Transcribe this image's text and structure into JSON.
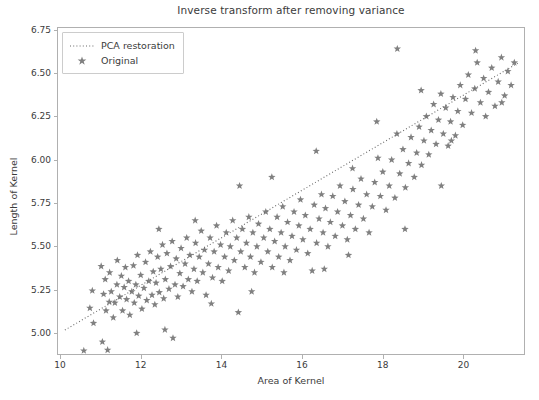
{
  "chart_data": {
    "type": "scatter",
    "title": "Inverse transform after removing variance",
    "xlabel": "Area of Kernel",
    "ylabel": "Length of Kernel",
    "xlim": [
      9.95,
      21.5
    ],
    "ylim": [
      4.88,
      6.76
    ],
    "grid": false,
    "legend_position": "upper left",
    "marker": "star",
    "marker_color": "#808080",
    "line_color": "#696969",
    "line_style": "dotted",
    "xticks": [
      10,
      12,
      14,
      16,
      18,
      20
    ],
    "xtick_labels": [
      "10",
      "12",
      "14",
      "16",
      "18",
      "20"
    ],
    "yticks": [
      5.0,
      5.25,
      5.5,
      5.75,
      6.0,
      6.25,
      6.5,
      6.75
    ],
    "ytick_labels": [
      "5.00",
      "5.25",
      "5.50",
      "5.75",
      "6.00",
      "6.25",
      "6.50",
      "6.75"
    ],
    "series": [
      {
        "name": "PCA restoration",
        "type": "line",
        "style": "dotted",
        "x": [
          10.12,
          21.35
        ],
        "y": [
          5.018,
          6.558
        ]
      },
      {
        "name": "Original",
        "type": "scatter",
        "marker": "star",
        "points": [
          [
            10.59,
            4.899
          ],
          [
            10.74,
            5.145
          ],
          [
            10.8,
            5.245
          ],
          [
            10.83,
            5.058
          ],
          [
            11.02,
            5.386
          ],
          [
            11.08,
            5.225
          ],
          [
            11.12,
            5.31
          ],
          [
            11.14,
            5.13
          ],
          [
            11.18,
            4.903
          ],
          [
            11.22,
            5.18
          ],
          [
            11.23,
            5.35
          ],
          [
            11.27,
            5.24
          ],
          [
            11.32,
            5.09
          ],
          [
            11.36,
            5.175
          ],
          [
            11.41,
            5.28
          ],
          [
            11.42,
            5.42
          ],
          [
            11.48,
            5.21
          ],
          [
            11.52,
            5.33
          ],
          [
            11.55,
            5.13
          ],
          [
            11.59,
            5.265
          ],
          [
            11.62,
            5.38
          ],
          [
            11.65,
            5.195
          ],
          [
            11.7,
            5.3
          ],
          [
            11.73,
            5.105
          ],
          [
            11.78,
            5.24
          ],
          [
            11.82,
            5.39
          ],
          [
            11.84,
            5.175
          ],
          [
            11.88,
            5.28
          ],
          [
            11.92,
            5.45
          ],
          [
            11.95,
            5.215
          ],
          [
            12.0,
            5.335
          ],
          [
            12.03,
            5.14
          ],
          [
            12.08,
            5.26
          ],
          [
            12.12,
            5.41
          ],
          [
            12.15,
            5.19
          ],
          [
            12.2,
            5.3
          ],
          [
            12.24,
            5.47
          ],
          [
            12.28,
            5.22
          ],
          [
            12.31,
            5.355
          ],
          [
            12.35,
            5.165
          ],
          [
            12.38,
            5.29
          ],
          [
            12.42,
            5.44
          ],
          [
            12.46,
            5.235
          ],
          [
            12.5,
            5.37
          ],
          [
            12.54,
            5.51
          ],
          [
            12.57,
            5.2
          ],
          [
            12.61,
            5.31
          ],
          [
            12.65,
            5.46
          ],
          [
            12.7,
            5.255
          ],
          [
            12.74,
            5.385
          ],
          [
            12.78,
            5.53
          ],
          [
            12.8,
            4.972
          ],
          [
            12.85,
            5.28
          ],
          [
            12.88,
            5.43
          ],
          [
            12.92,
            5.21
          ],
          [
            12.97,
            5.345
          ],
          [
            13.0,
            5.49
          ],
          [
            13.05,
            5.27
          ],
          [
            13.1,
            5.4
          ],
          [
            13.14,
            5.55
          ],
          [
            13.18,
            5.31
          ],
          [
            13.22,
            5.45
          ],
          [
            13.27,
            5.24
          ],
          [
            13.32,
            5.37
          ],
          [
            13.36,
            5.52
          ],
          [
            13.4,
            5.3
          ],
          [
            13.45,
            5.44
          ],
          [
            13.5,
            5.59
          ],
          [
            13.54,
            5.35
          ],
          [
            13.58,
            5.48
          ],
          [
            13.62,
            5.22
          ],
          [
            13.68,
            5.4
          ],
          [
            13.72,
            5.55
          ],
          [
            13.78,
            5.32
          ],
          [
            13.82,
            5.47
          ],
          [
            13.88,
            5.62
          ],
          [
            13.92,
            5.38
          ],
          [
            13.98,
            5.51
          ],
          [
            14.02,
            5.3
          ],
          [
            14.08,
            5.44
          ],
          [
            14.12,
            5.58
          ],
          [
            14.18,
            5.36
          ],
          [
            14.22,
            5.5
          ],
          [
            14.28,
            5.65
          ],
          [
            14.32,
            5.42
          ],
          [
            14.38,
            5.55
          ],
          [
            14.42,
            5.12
          ],
          [
            14.48,
            5.47
          ],
          [
            14.52,
            5.6
          ],
          [
            14.58,
            5.38
          ],
          [
            14.62,
            5.52
          ],
          [
            14.68,
            5.67
          ],
          [
            14.72,
            5.44
          ],
          [
            14.78,
            5.58
          ],
          [
            14.82,
            5.35
          ],
          [
            14.88,
            5.5
          ],
          [
            14.92,
            5.63
          ],
          [
            14.98,
            5.41
          ],
          [
            15.05,
            5.55
          ],
          [
            15.1,
            5.7
          ],
          [
            15.15,
            5.47
          ],
          [
            15.2,
            5.6
          ],
          [
            15.26,
            5.38
          ],
          [
            15.32,
            5.53
          ],
          [
            15.38,
            5.67
          ],
          [
            15.42,
            5.44
          ],
          [
            15.48,
            5.58
          ],
          [
            15.52,
            5.73
          ],
          [
            15.58,
            5.5
          ],
          [
            15.64,
            5.64
          ],
          [
            15.7,
            5.42
          ],
          [
            15.75,
            5.56
          ],
          [
            15.8,
            5.7
          ],
          [
            15.86,
            5.48
          ],
          [
            15.92,
            5.62
          ],
          [
            15.96,
            5.77
          ],
          [
            16.02,
            5.54
          ],
          [
            16.08,
            5.68
          ],
          [
            16.14,
            5.46
          ],
          [
            16.2,
            5.6
          ],
          [
            16.25,
            5.36
          ],
          [
            16.3,
            5.74
          ],
          [
            16.36,
            5.52
          ],
          [
            16.42,
            5.66
          ],
          [
            16.48,
            5.8
          ],
          [
            16.52,
            5.58
          ],
          [
            16.58,
            5.72
          ],
          [
            16.64,
            5.5
          ],
          [
            16.7,
            5.64
          ],
          [
            16.76,
            5.79
          ],
          [
            16.82,
            5.56
          ],
          [
            16.88,
            5.7
          ],
          [
            16.94,
            5.85
          ],
          [
            17.0,
            5.62
          ],
          [
            17.06,
            5.76
          ],
          [
            17.12,
            5.54
          ],
          [
            17.2,
            5.68
          ],
          [
            17.26,
            5.83
          ],
          [
            17.32,
            5.6
          ],
          [
            17.4,
            5.74
          ],
          [
            17.46,
            5.89
          ],
          [
            17.52,
            5.66
          ],
          [
            17.6,
            5.8
          ],
          [
            17.66,
            5.58
          ],
          [
            17.74,
            5.73
          ],
          [
            17.8,
            5.87
          ],
          [
            17.88,
            6.01
          ],
          [
            17.94,
            5.79
          ],
          [
            18.0,
            5.93
          ],
          [
            18.08,
            5.71
          ],
          [
            18.16,
            5.85
          ],
          [
            18.22,
            6.0
          ],
          [
            18.3,
            5.78
          ],
          [
            18.36,
            6.64
          ],
          [
            18.42,
            5.92
          ],
          [
            18.5,
            6.06
          ],
          [
            18.56,
            5.84
          ],
          [
            18.64,
            5.98
          ],
          [
            18.7,
            6.13
          ],
          [
            18.78,
            5.9
          ],
          [
            18.84,
            6.04
          ],
          [
            18.9,
            6.19
          ],
          [
            18.96,
            5.97
          ],
          [
            19.02,
            6.11
          ],
          [
            19.08,
            6.25
          ],
          [
            19.14,
            6.03
          ],
          [
            19.2,
            6.17
          ],
          [
            19.26,
            6.32
          ],
          [
            19.32,
            6.09
          ],
          [
            19.38,
            6.23
          ],
          [
            19.44,
            6.38
          ],
          [
            19.5,
            6.15
          ],
          [
            19.56,
            6.3
          ],
          [
            19.62,
            6.08
          ],
          [
            19.68,
            6.22
          ],
          [
            19.74,
            6.36
          ],
          [
            19.8,
            6.14
          ],
          [
            19.86,
            6.28
          ],
          [
            19.92,
            6.43
          ],
          [
            19.98,
            6.2
          ],
          [
            20.05,
            6.35
          ],
          [
            20.12,
            6.49
          ],
          [
            20.2,
            6.27
          ],
          [
            20.28,
            6.41
          ],
          [
            20.34,
            6.56
          ],
          [
            20.42,
            6.33
          ],
          [
            20.5,
            6.47
          ],
          [
            20.55,
            6.25
          ],
          [
            20.62,
            6.39
          ],
          [
            20.7,
            6.53
          ],
          [
            20.78,
            6.31
          ],
          [
            20.86,
            6.45
          ],
          [
            20.94,
            6.59
          ],
          [
            21.02,
            6.37
          ],
          [
            21.1,
            6.51
          ],
          [
            21.18,
            6.43
          ],
          [
            21.26,
            6.56
          ],
          [
            20.3,
            6.63
          ],
          [
            19.7,
            6.11
          ],
          [
            18.95,
            6.4
          ],
          [
            18.35,
            6.15
          ],
          [
            17.85,
            6.22
          ],
          [
            17.25,
            5.95
          ],
          [
            16.55,
            5.37
          ],
          [
            15.55,
            5.35
          ],
          [
            14.75,
            5.24
          ],
          [
            13.75,
            5.17
          ],
          [
            12.6,
            5.02
          ],
          [
            11.9,
            5.0
          ],
          [
            11.05,
            4.95
          ],
          [
            20.95,
            6.33
          ],
          [
            19.45,
            5.85
          ],
          [
            18.55,
            5.6
          ],
          [
            17.15,
            5.45
          ],
          [
            16.35,
            6.05
          ],
          [
            15.25,
            5.9
          ],
          [
            14.45,
            5.85
          ],
          [
            13.35,
            5.65
          ],
          [
            12.45,
            5.6
          ]
        ]
      }
    ]
  }
}
